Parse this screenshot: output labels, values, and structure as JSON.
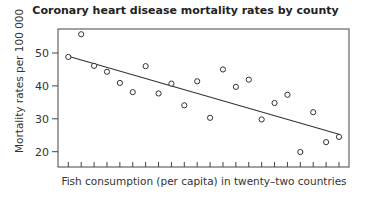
{
  "chart_data": {
    "type": "scatter",
    "title": "Coronary heart disease mortality rates by county",
    "xlabel": "Fish consumption (per capita) in twenty–two countries",
    "ylabel": "Mortality rates per 100 000",
    "yticks": [
      20,
      30,
      40,
      50
    ],
    "ylim": [
      15,
      56.5
    ],
    "x_tick_count": 22,
    "grid": false,
    "legend": null,
    "x": [
      1,
      2,
      3,
      4,
      5,
      6,
      7,
      8,
      9,
      10,
      11,
      12,
      13,
      14,
      15,
      16,
      17,
      18,
      19,
      20,
      21,
      22
    ],
    "values": [
      48.8,
      55.7,
      46.1,
      44.3,
      40.9,
      38.1,
      46.0,
      37.7,
      40.7,
      34.1,
      41.4,
      30.3,
      45.0,
      39.7,
      41.9,
      29.8,
      34.8,
      37.3,
      19.9,
      32.0,
      22.9,
      24.5
    ],
    "trend_line": {
      "x_start": 1,
      "y_start": 49.0,
      "x_end": 22,
      "y_end": 25.3
    }
  },
  "labels": {
    "title": "Coronary heart disease mortality rates by county",
    "xlabel": "Fish consumption (per capita) in twenty–two countries",
    "ylabel": "Mortality rates per 100 000",
    "ytick_20": "20",
    "ytick_30": "30",
    "ytick_40": "40",
    "ytick_50": "50"
  },
  "colors": {
    "axis": "#333333",
    "marker": "#333333",
    "line": "#333333"
  }
}
